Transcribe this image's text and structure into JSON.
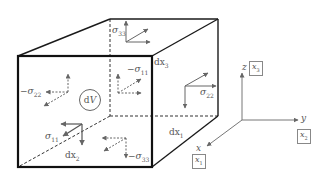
{
  "diagram": {
    "type": "stress-element-cube",
    "volume_label": {
      "d": "d",
      "V": "V"
    },
    "edge_labels": {
      "dx3": {
        "prefix": "dx",
        "sub": "3"
      },
      "dx1": {
        "prefix": "dx",
        "sub": "1"
      },
      "dx2": {
        "prefix": "dx",
        "sub": "2"
      }
    },
    "stress_labels": {
      "sigma33_top": {
        "sign": "",
        "sym": "σ",
        "sub": "33"
      },
      "sigma11_back_neg": {
        "sign": "−",
        "sym": "σ",
        "sub": "11"
      },
      "sigma22_left_neg": {
        "sign": "−",
        "sym": "σ",
        "sub": "22"
      },
      "sigma22_right": {
        "sign": "",
        "sym": "σ",
        "sub": "22"
      },
      "sigma11_front": {
        "sign": "",
        "sym": "σ",
        "sub": "11"
      },
      "sigma33_bottom_neg": {
        "sign": "−",
        "sym": "σ",
        "sub": "33"
      }
    },
    "axes": {
      "z": {
        "name": "z",
        "box": "x",
        "box_sub": "3"
      },
      "y": {
        "name": "y",
        "box": "x",
        "box_sub": "2"
      },
      "x": {
        "name": "x",
        "box": "x",
        "box_sub": "1"
      }
    },
    "colors": {
      "edge": "#1a1a1a",
      "arrow": "#666666",
      "text": "#555555"
    }
  }
}
